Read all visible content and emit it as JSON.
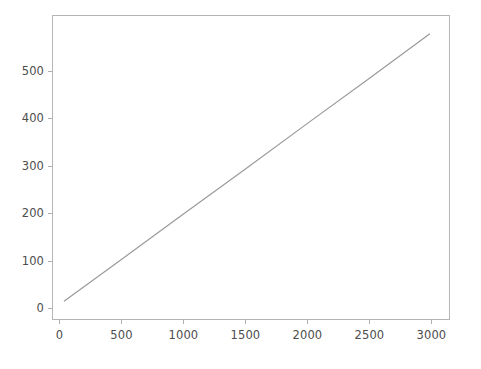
{
  "figure": {
    "background_color": "#ffffff",
    "width_px": 481,
    "height_px": 369
  },
  "axes": {
    "spine_color": "#b5b5b5",
    "tick_color": "#b0b0b0",
    "tick_label_color": "#4d4d4d",
    "left_px": 52,
    "top_px": 15,
    "width_px": 398,
    "height_px": 305
  },
  "chart_data": {
    "type": "line",
    "title": "",
    "xlabel": "",
    "ylabel": "",
    "xlim": [
      -60,
      3150
    ],
    "ylim": [
      -25,
      617
    ],
    "grid": false,
    "legend": null,
    "xticks": [
      0,
      500,
      1000,
      1500,
      2000,
      2500,
      3000
    ],
    "xtick_labels": [
      "0",
      "500",
      "1000",
      "1500",
      "2000",
      "2500",
      "3000"
    ],
    "yticks": [
      0,
      100,
      200,
      300,
      400,
      500
    ],
    "ytick_labels": [
      "0",
      "100",
      "200",
      "300",
      "400",
      "500"
    ],
    "series": [
      {
        "name": "series-1",
        "color": "#9a9a9a",
        "linewidth": 1.2,
        "marker": "none",
        "x": [
          32,
          500,
          1000,
          1500,
          2000,
          2500,
          2992
        ],
        "y": [
          13,
          102,
          198,
          293,
          389,
          484,
          579
        ]
      }
    ],
    "annotations": []
  }
}
